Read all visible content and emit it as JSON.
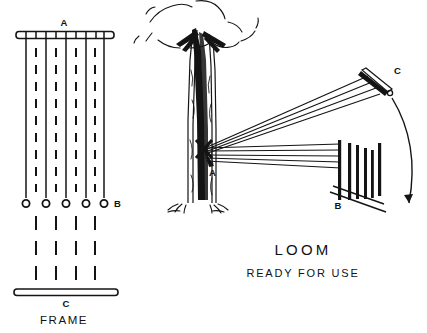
{
  "figure": {
    "title_caption": "LOOM",
    "subtitle_caption": "READY  FOR  USE",
    "left_panel": {
      "name": "frame-diagram",
      "caption": "FRAME",
      "labels": {
        "top_bar": "A",
        "ring_row": "B",
        "bottom_bar": "C"
      },
      "warp_thread_count": 5,
      "dashed_thread_count": 4,
      "ring_count": 5,
      "top_bar_tick_count": 9
    },
    "right_panel": {
      "name": "loom-in-use-diagram",
      "labels": {
        "tree_anchor": "A",
        "comb_bar": "B",
        "far_bar": "C"
      },
      "thread_count_upper": 4,
      "thread_count_lower": 4,
      "comb_tooth_count": 6,
      "motion_arrow": "curved-down-arrow"
    },
    "colors": {
      "ink": "#141414",
      "background": "#ffffff"
    }
  }
}
